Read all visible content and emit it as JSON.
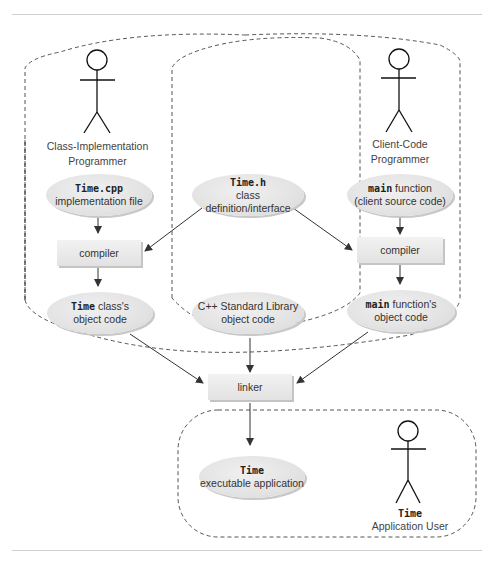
{
  "actors": [
    {
      "id": "class-impl",
      "line1": "Class-Implementation",
      "line2": "Programmer"
    },
    {
      "id": "client-code",
      "line1": "Client-Code",
      "line2": "Programmer"
    },
    {
      "id": "app-user",
      "code": "Time",
      "line2": "Application User"
    }
  ],
  "nodes": {
    "time_cpp": {
      "code": "Time.cpp",
      "text": "implementation file"
    },
    "time_h": {
      "code": "Time.h",
      "text": "class definition/interface"
    },
    "main_fn": {
      "code": "main",
      "text_inline": " function",
      "text": "(client source code)"
    },
    "compiler_left": {
      "text": "compiler"
    },
    "compiler_right": {
      "text": "compiler"
    },
    "time_obj": {
      "code": "Time",
      "text_inline": " class's",
      "text": "object code"
    },
    "stdlib_obj": {
      "text1": "C++ Standard Library",
      "text": "object code"
    },
    "main_obj": {
      "code": "main",
      "text_inline": " function's",
      "text": "object code"
    },
    "linker": {
      "text": "linker"
    },
    "time_exe": {
      "code": "Time",
      "text": "executable application"
    }
  },
  "colors": {
    "node_fill": "#e3e3e3",
    "rule": "#cfcfcf",
    "dash": "#555555",
    "arrow": "#333333"
  }
}
